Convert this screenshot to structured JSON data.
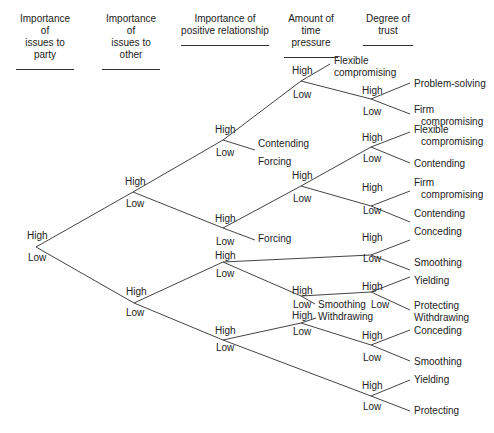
{
  "headers": [
    {
      "id": "party",
      "line1": "Importance of",
      "line2": "issues to party",
      "x": 16,
      "w": 58
    },
    {
      "id": "other",
      "line1": "Importance of",
      "line2": "issues to other",
      "x": 102,
      "w": 58
    },
    {
      "id": "relationship",
      "line1": "Importance of",
      "line2": "positive relationship",
      "x": 181,
      "w": 88
    },
    {
      "id": "time",
      "line1": "Amount of",
      "line2": "time pressure",
      "x": 284,
      "w": 54
    },
    {
      "id": "trust",
      "line1": "Degree of",
      "line2": "trust",
      "x": 363,
      "w": 50
    }
  ],
  "edges": [
    [
      36,
      247,
      133,
      192
    ],
    [
      36,
      247,
      134,
      303
    ],
    [
      133,
      192,
      223,
      140
    ],
    [
      133,
      192,
      223,
      228
    ],
    [
      134,
      303,
      223,
      262
    ],
    [
      134,
      303,
      223,
      340
    ],
    [
      223,
      140,
      301,
      81
    ],
    [
      223,
      140,
      255,
      150
    ],
    [
      223,
      228,
      301,
      186
    ],
    [
      223,
      228,
      255,
      240
    ],
    [
      223,
      262,
      371,
      255
    ],
    [
      223,
      262,
      301,
      296
    ],
    [
      223,
      340,
      301,
      323
    ],
    [
      223,
      340,
      371,
      396
    ],
    [
      301,
      81,
      330,
      64
    ],
    [
      301,
      81,
      371,
      99
    ],
    [
      301,
      186,
      371,
      147
    ],
    [
      301,
      186,
      371,
      206
    ],
    [
      301,
      296,
      371,
      292
    ],
    [
      301,
      296,
      315,
      304
    ],
    [
      301,
      323,
      316,
      318
    ],
    [
      301,
      323,
      371,
      345
    ],
    [
      371,
      99,
      410,
      83
    ],
    [
      371,
      99,
      410,
      114
    ],
    [
      371,
      147,
      410,
      132
    ],
    [
      371,
      147,
      410,
      163
    ],
    [
      371,
      206,
      410,
      191
    ],
    [
      371,
      206,
      410,
      222
    ],
    [
      371,
      255,
      410,
      240
    ],
    [
      371,
      255,
      410,
      270
    ],
    [
      371,
      292,
      410,
      277
    ],
    [
      371,
      292,
      410,
      310
    ],
    [
      371,
      345,
      410,
      330
    ],
    [
      371,
      345,
      410,
      361
    ],
    [
      371,
      396,
      410,
      380
    ],
    [
      371,
      396,
      410,
      411
    ]
  ],
  "branch_labels": [
    {
      "text": "High",
      "x": 27,
      "y": 230
    },
    {
      "text": "Low",
      "x": 28,
      "y": 252
    },
    {
      "text": "High",
      "x": 125,
      "y": 176
    },
    {
      "text": "Low",
      "x": 126,
      "y": 198
    },
    {
      "text": "High",
      "x": 126,
      "y": 286
    },
    {
      "text": "Low",
      "x": 126,
      "y": 307
    },
    {
      "text": "High",
      "x": 215,
      "y": 124
    },
    {
      "text": "Low",
      "x": 216,
      "y": 147
    },
    {
      "text": "High",
      "x": 215,
      "y": 213
    },
    {
      "text": "Low",
      "x": 216,
      "y": 236
    },
    {
      "text": "High",
      "x": 215,
      "y": 250
    },
    {
      "text": "Low",
      "x": 216,
      "y": 268
    },
    {
      "text": "High",
      "x": 215,
      "y": 325
    },
    {
      "text": "Low",
      "x": 216,
      "y": 342
    },
    {
      "text": "High",
      "x": 292,
      "y": 65
    },
    {
      "text": "Low",
      "x": 293,
      "y": 89
    },
    {
      "text": "High",
      "x": 292,
      "y": 170
    },
    {
      "text": "Low",
      "x": 293,
      "y": 193
    },
    {
      "text": "High",
      "x": 292,
      "y": 285
    },
    {
      "text": "Low",
      "x": 293,
      "y": 299
    },
    {
      "text": "High",
      "x": 292,
      "y": 310
    },
    {
      "text": "Low",
      "x": 293,
      "y": 326
    },
    {
      "text": "High",
      "x": 362,
      "y": 85
    },
    {
      "text": "Low",
      "x": 363,
      "y": 106
    },
    {
      "text": "High",
      "x": 362,
      "y": 132
    },
    {
      "text": "Low",
      "x": 363,
      "y": 153
    },
    {
      "text": "High",
      "x": 362,
      "y": 182
    },
    {
      "text": "Low",
      "x": 363,
      "y": 205
    },
    {
      "text": "High",
      "x": 362,
      "y": 232
    },
    {
      "text": "Low",
      "x": 363,
      "y": 253
    },
    {
      "text": "High",
      "x": 362,
      "y": 281
    },
    {
      "text": "Low",
      "x": 371,
      "y": 299
    },
    {
      "text": "High",
      "x": 362,
      "y": 330
    },
    {
      "text": "Low",
      "x": 363,
      "y": 352
    },
    {
      "text": "High",
      "x": 362,
      "y": 380
    },
    {
      "text": "Low",
      "x": 363,
      "y": 401
    }
  ],
  "outcomes": [
    {
      "line1": "Flexible",
      "line2": "compromising",
      "x": 334,
      "y": 55,
      "indent": false
    },
    {
      "line1": "Problem-solving",
      "line2": "",
      "x": 414,
      "y": 78,
      "indent": true
    },
    {
      "line1": "Firm",
      "line2": "compromising",
      "x": 414,
      "y": 104,
      "indent": true
    },
    {
      "line1": "Contending",
      "line2": "",
      "x": 258,
      "y": 138,
      "indent": false
    },
    {
      "line1": "Forcing",
      "line2": "",
      "x": 258,
      "y": 156,
      "indent": false
    },
    {
      "line1": "Flexible",
      "line2": "compromising",
      "x": 414,
      "y": 124,
      "indent": true
    },
    {
      "line1": "Contending",
      "line2": "",
      "x": 414,
      "y": 158,
      "indent": false
    },
    {
      "line1": "Firm",
      "line2": "compromising",
      "x": 414,
      "y": 177,
      "indent": true
    },
    {
      "line1": "Contending",
      "line2": "",
      "x": 414,
      "y": 208,
      "indent": false
    },
    {
      "line1": "Forcing",
      "line2": "",
      "x": 258,
      "y": 233,
      "indent": false
    },
    {
      "line1": "Conceding",
      "line2": "",
      "x": 414,
      "y": 226,
      "indent": false
    },
    {
      "line1": "Smoothing",
      "line2": "",
      "x": 414,
      "y": 257,
      "indent": false
    },
    {
      "line1": "Yielding",
      "line2": "",
      "x": 414,
      "y": 275,
      "indent": false
    },
    {
      "line1": "Smoothing",
      "line2": "",
      "x": 318,
      "y": 299,
      "indent": false
    },
    {
      "line1": "Withdrawing",
      "line2": "",
      "x": 318,
      "y": 311,
      "indent": false
    },
    {
      "line1": "Protecting",
      "line2": "Withdrawing",
      "x": 414,
      "y": 300,
      "indent": false
    },
    {
      "line1": "Conceding",
      "line2": "",
      "x": 414,
      "y": 325,
      "indent": false
    },
    {
      "line1": "Smoothing",
      "line2": "",
      "x": 414,
      "y": 356,
      "indent": false
    },
    {
      "line1": "Yielding",
      "line2": "",
      "x": 414,
      "y": 374,
      "indent": false
    },
    {
      "line1": "Protecting",
      "line2": "",
      "x": 414,
      "y": 405,
      "indent": false
    }
  ],
  "style": {
    "line_color": "#444444",
    "text_color": "#222222",
    "background": "#ffffff"
  }
}
